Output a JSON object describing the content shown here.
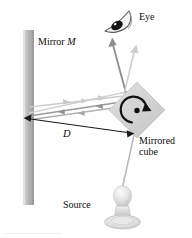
{
  "figure": {
    "background_color": "#ffffff",
    "width": 192,
    "height": 238,
    "labels": {
      "mirror": "Mirror M",
      "mirror_text": "Mirror ",
      "mirror_symbol": "M",
      "eye": "Eye",
      "distance": "D",
      "cube_line1": "Mirrored",
      "cube_line2": "cube",
      "source": "Source"
    },
    "colors": {
      "text": "#0d0d0d",
      "mirror_bar": "#b3b3b3",
      "mirror_bar_highlight": "#d8d8d8",
      "cube_fill": "#d6d6d6",
      "cube_edge": "#c2c2c2",
      "beam_light": "#c9c9c9",
      "beam_dark": "#8f8f8f",
      "beam_darkest": "#6b6b6b",
      "rotation_arrow": "#101010",
      "bulb": "#e2e2e2",
      "bulb_shade": "#bdbdbd",
      "dimension_line": "#1a1a1a"
    },
    "elements": {
      "mirror_bar": {
        "x": 23,
        "y": 30,
        "width": 11,
        "height": 175
      },
      "mirrored_cube": {
        "center_x": 137,
        "center_y": 110,
        "size": 40,
        "rotation_deg": 45
      },
      "rotation_indicator": {
        "center_x": 137,
        "center_y": 110,
        "radius": 13,
        "direction": "clockwise"
      },
      "eye": {
        "x": 104,
        "y": 10,
        "width": 28,
        "height": 24
      },
      "light_source": {
        "x": 108,
        "y": 186,
        "width": 32,
        "height": 48
      },
      "distance_marker": {
        "x1": 25,
        "y1": 118,
        "x2": 133,
        "y2": 133,
        "label": "D"
      }
    }
  }
}
